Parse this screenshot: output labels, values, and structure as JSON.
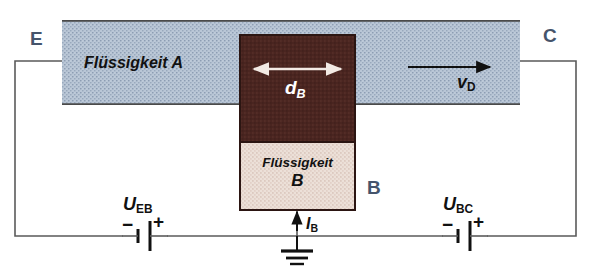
{
  "figure": {
    "type": "schematic-diagram",
    "background_color": "#ffffff"
  },
  "regions": {
    "liquid_a": {
      "label": "Flüssigkeit A",
      "fill_color": "#b9c6d6",
      "texture": "stipple",
      "border_color": "#4a4a4a"
    },
    "base_block": {
      "fill_color": "#4a2520",
      "texture": "stipple",
      "border_color": "#2b1512"
    },
    "liquid_b": {
      "label_line1": "Flüssigkeit",
      "label_line2": "B",
      "fill_color": "#ece0d8",
      "texture": "stipple",
      "border_color": "#2b1512"
    }
  },
  "terminals": {
    "emitter": "E",
    "collector": "C",
    "base": "B",
    "color": "#45546b"
  },
  "annotations": {
    "base_width": {
      "base": "d",
      "sub": "B",
      "color": "#ffffff"
    },
    "drift_velocity": {
      "base": "v",
      "sub": "D",
      "color": "#111111"
    },
    "base_current": {
      "base": "I",
      "sub": "B",
      "color": "#111111"
    }
  },
  "sources": {
    "u_eb": {
      "base": "U",
      "sub": "EB",
      "minus": "−",
      "plus": "+",
      "minus_side": "left",
      "plus_side": "right"
    },
    "u_bc": {
      "base": "U",
      "sub": "BC",
      "minus": "−",
      "plus": "+",
      "minus_side": "left",
      "plus_side": "right"
    }
  },
  "circuit": {
    "wire_color": "#5a5a5a",
    "ground_symbol": "earth-ground",
    "arrows": {
      "d_b": "double-headed-horizontal",
      "v_d": "right",
      "i_b": "up"
    }
  }
}
